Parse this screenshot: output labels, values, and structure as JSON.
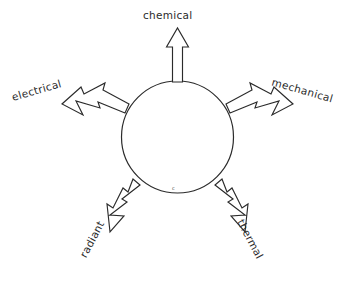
{
  "diagram": {
    "type": "radial-arrow-diagram",
    "background_color": "#ffffff",
    "stroke_color": "#2b2b2b",
    "center": {
      "shape": "circle",
      "cx": 177.5,
      "cy": 137,
      "r": 56,
      "inner_mark": "c"
    },
    "arrows": [
      {
        "id": "chemical",
        "label": "chemical",
        "direction": "up",
        "angle_deg": 90,
        "style": "hollow-outline-arrow"
      },
      {
        "id": "electrical",
        "label": "electrical",
        "direction": "upper-left",
        "angle_deg": 162,
        "style": "hollow-outline-arrow"
      },
      {
        "id": "mechanical",
        "label": "mechanical",
        "direction": "upper-right",
        "angle_deg": 18,
        "style": "hollow-outline-arrow"
      },
      {
        "id": "radiant",
        "label": "radiant",
        "direction": "lower-left",
        "angle_deg": 234,
        "style": "hollow-outline-arrow"
      },
      {
        "id": "thermal",
        "label": "thermal",
        "direction": "lower-right",
        "angle_deg": 306,
        "style": "hollow-outline-arrow"
      }
    ]
  }
}
